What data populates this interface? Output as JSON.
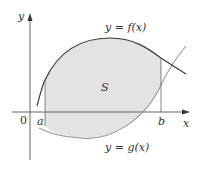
{
  "diagram": {
    "axes": {
      "x_label": "x",
      "y_label": "y",
      "origin_label": "0"
    },
    "bounds": {
      "a_label": "a",
      "b_label": "b"
    },
    "curves": {
      "upper_label": "y = f(x)",
      "lower_label": "y = g(x)"
    },
    "region_label": "S",
    "colors": {
      "fill": "#e3e3e3",
      "upper_curve": "#3a3a3a",
      "lower_curve": "#9a9a9a",
      "axis": "#555555"
    }
  }
}
